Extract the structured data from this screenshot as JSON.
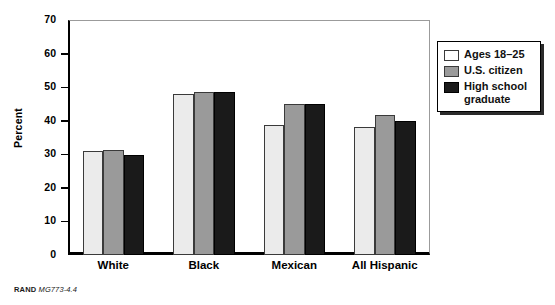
{
  "chart_data": {
    "type": "bar",
    "title": "",
    "xlabel": "",
    "ylabel": "Percent",
    "ylim": [
      0,
      70
    ],
    "ytick_step": 10,
    "yticks": [
      70,
      60,
      50,
      40,
      30,
      20,
      10,
      0
    ],
    "grid": false,
    "legend_position": "right-outside",
    "categories": [
      "White",
      "Black",
      "Mexican",
      "All Hispanic"
    ],
    "series": [
      {
        "name": "Ages 18–25",
        "color": "#ebebeb",
        "values": [
          31.0,
          48.0,
          38.8,
          38.0
        ]
      },
      {
        "name": "U.S. citizen",
        "color": "#9a9a9a",
        "values": [
          31.3,
          48.7,
          45.0,
          41.7
        ]
      },
      {
        "name": "High school graduate",
        "color": "#1a1a1a",
        "values": [
          29.8,
          48.7,
          45.0,
          40.0
        ]
      }
    ]
  },
  "legend": {
    "items": [
      {
        "label": "Ages 18–25"
      },
      {
        "label": "U.S. citizen"
      },
      {
        "label": "High school graduate"
      }
    ]
  },
  "footer": {
    "brand": "RAND",
    "code": "MG773-4.4"
  }
}
